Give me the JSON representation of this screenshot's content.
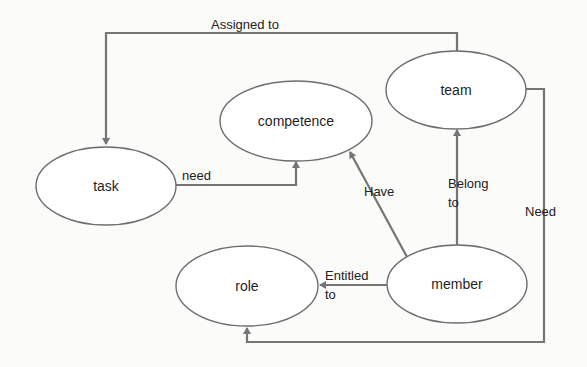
{
  "diagram": {
    "type": "entity-relationship",
    "colors": {
      "background": "#fbfbfa",
      "node_fill": "#ffffff",
      "node_stroke": "#6e6e6e",
      "edge_stroke": "#757575",
      "text": "#1f1f1f"
    },
    "nodes": [
      {
        "id": "task",
        "label": "task"
      },
      {
        "id": "competence",
        "label": "competence"
      },
      {
        "id": "team",
        "label": "team"
      },
      {
        "id": "role",
        "label": "role"
      },
      {
        "id": "member",
        "label": "member"
      }
    ],
    "edges": [
      {
        "from": "team",
        "to": "task",
        "label": "Assigned to"
      },
      {
        "from": "task",
        "to": "competence",
        "label": "need"
      },
      {
        "from": "member",
        "to": "competence",
        "label": "Have"
      },
      {
        "from": "member",
        "to": "team",
        "label_line1": "Belong",
        "label_line2": "to"
      },
      {
        "from": "member",
        "to": "role",
        "label_line1": "Entitled",
        "label_line2": "to"
      },
      {
        "from": "team",
        "to": "role",
        "label": "Need"
      }
    ]
  }
}
